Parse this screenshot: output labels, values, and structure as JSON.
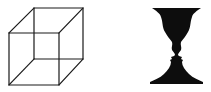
{
  "figures": [
    {
      "name": "Necker cube",
      "description": "Wireframe cube drawn in black lines on white",
      "stroke_color": "#1a1a1a"
    },
    {
      "name": "Rubin vase",
      "description": "Black vase silhouette whose edges form two facing profiles",
      "fill_color": "#0d0d0d"
    }
  ],
  "background": "#ffffff"
}
